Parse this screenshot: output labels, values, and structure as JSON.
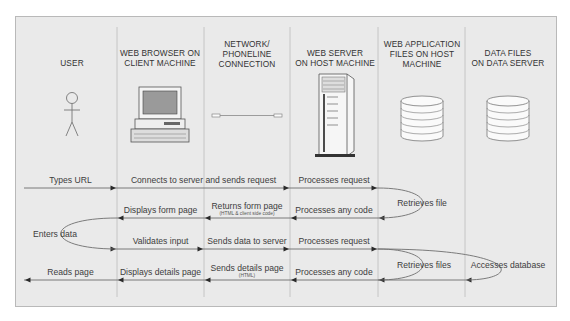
{
  "columns": [
    {
      "id": "user",
      "title_lines": [
        "USER"
      ],
      "icon": "stick-figure-icon"
    },
    {
      "id": "browser",
      "title_lines": [
        "WEB BROWSER ON",
        "CLIENT MACHINE"
      ],
      "icon": "desktop-computer-icon"
    },
    {
      "id": "network",
      "title_lines": [
        "NETWORK/",
        "PHONELINE",
        "CONNECTION"
      ],
      "icon": "network-cable-icon"
    },
    {
      "id": "webserver",
      "title_lines": [
        "WEB SERVER",
        "ON HOST MACHINE"
      ],
      "icon": "server-tower-icon"
    },
    {
      "id": "appfiles",
      "title_lines": [
        "WEB APPLICATION",
        "FILES ON HOST",
        "MACHINE"
      ],
      "icon": "database-icon"
    },
    {
      "id": "datafiles",
      "title_lines": [
        "DATA FILES",
        "ON DATA SERVER"
      ],
      "icon": "database-icon"
    }
  ],
  "steps": [
    {
      "label": "Types URL",
      "from": 0,
      "to": 1,
      "row": 0
    },
    {
      "label": "Connects to server and sends request",
      "from": 1,
      "to": 3,
      "row": 0
    },
    {
      "label": "Processes request",
      "from": 3,
      "to": 4,
      "row": 0
    },
    {
      "label": "Retrieves file",
      "loop": true,
      "at": 4,
      "rows": [
        0,
        1
      ]
    },
    {
      "label": "Processes any code",
      "from": 4,
      "to": 3,
      "row": 1
    },
    {
      "label": "Returns form page",
      "sublabel": "(HTML & client side code)",
      "from": 3,
      "to": 2,
      "row": 1
    },
    {
      "label": "Displays form page",
      "from": 2,
      "to": 1,
      "row": 1
    },
    {
      "label": "Enters data",
      "loop": true,
      "at": 1,
      "rows": [
        1,
        2
      ],
      "side": "left"
    },
    {
      "label": "Validates input",
      "from": 1,
      "to": 2,
      "row": 2
    },
    {
      "label": "Sends data to server",
      "from": 2,
      "to": 3,
      "row": 2
    },
    {
      "label": "Processes request",
      "from": 3,
      "to": 4,
      "row": 2
    },
    {
      "label": "Accesses database",
      "loop": true,
      "at": 5,
      "rows": [
        2,
        3
      ]
    },
    {
      "label": "Retrieves files",
      "loop": true,
      "at": 4,
      "rows": [
        2,
        3
      ]
    },
    {
      "label": "Processes any code",
      "from": 4,
      "to": 3,
      "row": 3
    },
    {
      "label": "Sends details page",
      "sublabel": "(HTML)",
      "from": 3,
      "to": 2,
      "row": 3
    },
    {
      "label": "Displays details page",
      "from": 2,
      "to": 1,
      "row": 3
    },
    {
      "label": "Reads page",
      "from": 1,
      "to": 0,
      "row": 3
    }
  ]
}
